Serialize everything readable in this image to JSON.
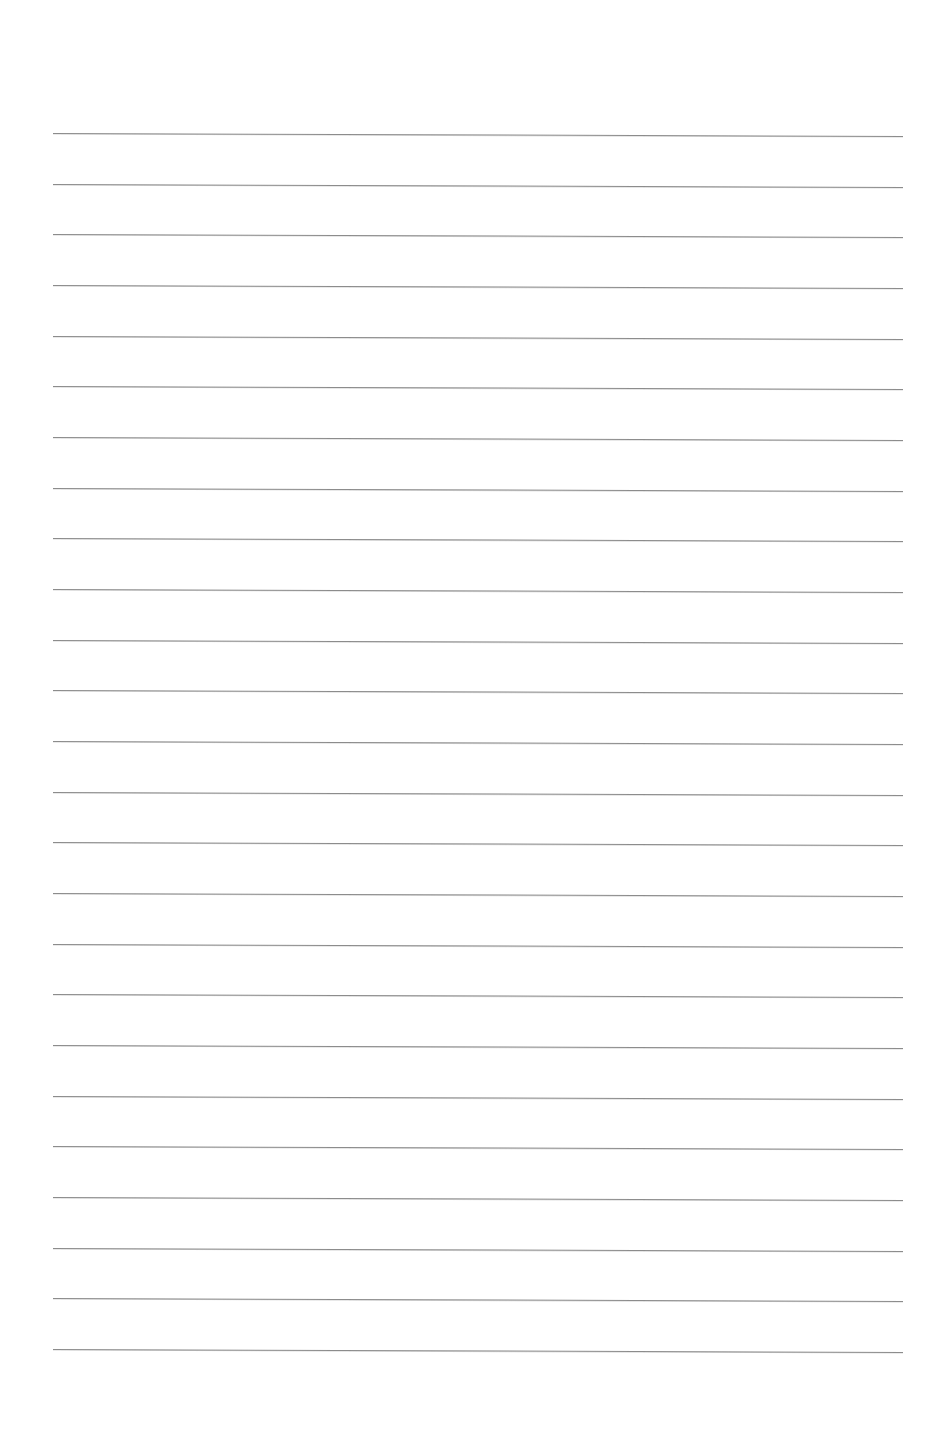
{
  "page": {
    "type": "blank-lined-paper",
    "background_color": "#ffffff",
    "rule_color": "#8c8c8c",
    "rule_count": 25,
    "rule_left_x": 53,
    "rule_right_x": 903,
    "first_rule_y": 133,
    "rule_spacing": 50.67,
    "rule_slope_px": 3,
    "text": ""
  }
}
